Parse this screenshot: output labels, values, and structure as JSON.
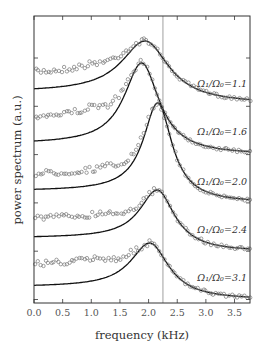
{
  "chart_data": {
    "type": "line",
    "title": "",
    "xlabel": "frequency (kHz)",
    "ylabel": "power spectrum (a.u.)",
    "xlim": [
      0.0,
      3.77
    ],
    "x_ticks": [
      "0.0",
      "0.5",
      "1.0",
      "1.5",
      "2.0",
      "2.5",
      "3.0",
      "3.5"
    ],
    "y_ticks_labeled": false,
    "grid": false,
    "legend": "inline labels per trace, right side",
    "vertical_reference_line": {
      "x": 2.25,
      "color": "#bbbbbb"
    },
    "marker": "open circles (data), solid black line (fit)",
    "series": [
      {
        "name": "Ω1/Ω0=1.1",
        "label": "Ω₁/Ω₀=1.1",
        "peak_freq": 1.94,
        "width": 0.75,
        "baseline_px": 92,
        "peak_px": 41,
        "tail_px": 104,
        "noise_lift": 17
      },
      {
        "name": "Ω1/Ω0=1.6",
        "label": "Ω₁/Ω₀=1.6",
        "peak_freq": 1.88,
        "width": 0.55,
        "baseline_px": 144,
        "peak_px": 63,
        "tail_px": 155,
        "noise_lift": 25
      },
      {
        "name": "Ω1/Ω0=2.0",
        "label": "Ω₁/Ω₀=2.0",
        "peak_freq": 2.16,
        "width": 0.45,
        "baseline_px": 191,
        "peak_px": 103,
        "tail_px": 203,
        "noise_lift": 16
      },
      {
        "name": "Ω1/Ω0=2.4",
        "label": "Ω₁/Ω₀=2.4",
        "peak_freq": 2.15,
        "width": 0.55,
        "baseline_px": 238,
        "peak_px": 190,
        "tail_px": 252,
        "noise_lift": 19
      },
      {
        "name": "Ω1/Ω0=3.1",
        "label": "Ω₁/Ω₀=3.1",
        "peak_freq": 2.02,
        "width": 0.6,
        "baseline_px": 287,
        "peak_px": 243,
        "tail_px": 300,
        "noise_lift": 22
      }
    ],
    "label_positions_px": [
      87,
      135,
      185,
      233,
      281
    ]
  }
}
